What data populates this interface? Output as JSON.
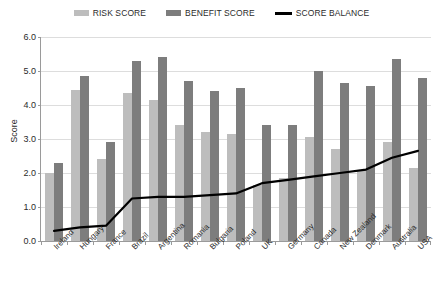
{
  "legend": {
    "items": [
      {
        "label": "RISK SCORE",
        "type": "swatch",
        "color": "#bdbdbd",
        "name": "legend-risk-score"
      },
      {
        "label": "BENEFIT SCORE",
        "type": "swatch",
        "color": "#7d7d7d",
        "name": "legend-benefit-score"
      },
      {
        "label": "SCORE BALANCE",
        "type": "line",
        "color": "#000000",
        "name": "legend-score-balance"
      }
    ]
  },
  "chart_data": {
    "type": "bar",
    "title": "",
    "xlabel": "",
    "ylabel": "Score",
    "ylim": [
      0,
      6
    ],
    "yticks": [
      "0.0",
      "1.0",
      "2.0",
      "3.0",
      "4.0",
      "5.0",
      "6.0"
    ],
    "ytick_values": [
      0,
      1,
      2,
      3,
      4,
      5,
      6
    ],
    "grid": true,
    "legend_position": "top-center",
    "categories": [
      "Ireland",
      "Hungary",
      "France",
      "Brazil",
      "Argentina",
      "Romania",
      "Bulgaria",
      "Poland",
      "UK",
      "Germany",
      "Canada",
      "New Zealand",
      "Denmark",
      "Australia",
      "USA"
    ],
    "series": [
      {
        "name": "RISK SCORE",
        "type": "bar",
        "color": "#bdbdbd",
        "values": [
          2.0,
          4.45,
          2.4,
          4.35,
          4.15,
          3.4,
          3.2,
          3.15,
          1.65,
          1.85,
          3.05,
          2.7,
          2.1,
          2.9,
          2.15
        ]
      },
      {
        "name": "BENEFIT SCORE",
        "type": "bar",
        "color": "#7d7d7d",
        "values": [
          2.3,
          4.85,
          2.9,
          5.3,
          5.4,
          4.7,
          4.4,
          4.5,
          3.4,
          3.4,
          5.0,
          4.65,
          4.55,
          5.35,
          4.8
        ]
      },
      {
        "name": "SCORE BALANCE",
        "type": "line",
        "color": "#000000",
        "values": [
          0.3,
          0.4,
          0.45,
          1.25,
          1.3,
          1.3,
          1.35,
          1.4,
          1.7,
          1.8,
          1.9,
          2.0,
          2.1,
          2.45,
          2.65
        ]
      }
    ]
  }
}
